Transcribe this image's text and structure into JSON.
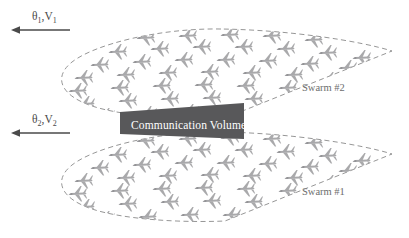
{
  "figure": {
    "background_color": "#ffffff"
  },
  "vectors": [
    {
      "id": "vector-1",
      "label_theta": "θ",
      "label_theta_sub": "1",
      "label_comma": ",",
      "label_v": "V",
      "label_v_sub": "1",
      "full_label": "θ1,V1",
      "direction": "left",
      "arrow_x_start": 70,
      "arrow_x_end": 12,
      "arrow_y": 30,
      "color": "#4a4a4a"
    },
    {
      "id": "vector-2",
      "label_theta": "θ",
      "label_theta_sub": "2",
      "label_comma": ",",
      "label_v": "V",
      "label_v_sub": "2",
      "full_label": "θ2,V2",
      "direction": "left",
      "arrow_x_start": 70,
      "arrow_x_end": 12,
      "arrow_y": 133,
      "color": "#4a4a4a"
    }
  ],
  "swarms": [
    {
      "id": "swarm-2",
      "label": "Swarm #2",
      "label_x": 302,
      "label_y": 91,
      "position": "upper",
      "outline_style": "dashed",
      "outline_color": "#8a8a8a",
      "aircraft_count": 54,
      "aircraft_heading": "left"
    },
    {
      "id": "swarm-1",
      "label": "Swarm #1",
      "label_x": 302,
      "label_y": 195,
      "position": "lower",
      "outline_style": "dashed",
      "outline_color": "#8a8a8a",
      "aircraft_count": 54,
      "aircraft_heading": "left"
    }
  ],
  "communication_volume": {
    "label": "Communication Volume",
    "fill_color": "#58585a",
    "text_color": "#ffffff",
    "text_x": 131,
    "text_y": 129,
    "x": 120,
    "y": 103,
    "width": 142,
    "height": 36
  },
  "icon_names": {
    "aircraft": "aircraft-icon",
    "arrow_left": "arrow-left-icon"
  }
}
